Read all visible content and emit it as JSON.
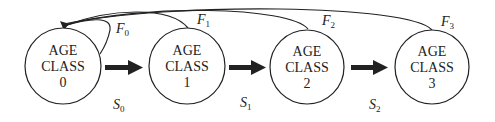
{
  "diagram": {
    "type": "age-structured population model (Leslie diagram)",
    "colors": {
      "stroke": "#222222",
      "background": "#ffffff"
    },
    "nodes": [
      {
        "id": "class0",
        "line1": "AGE",
        "line2": "CLASS",
        "line3": "0"
      },
      {
        "id": "class1",
        "line1": "AGE",
        "line2": "CLASS",
        "line3": "1"
      },
      {
        "id": "class2",
        "line1": "AGE",
        "line2": "CLASS",
        "line3": "2"
      },
      {
        "id": "class3",
        "line1": "AGE",
        "line2": "CLASS",
        "line3": "3"
      }
    ],
    "fecundity_labels": [
      {
        "base": "F",
        "sub": "0"
      },
      {
        "base": "F",
        "sub": "1"
      },
      {
        "base": "F",
        "sub": "2"
      },
      {
        "base": "F",
        "sub": "3"
      }
    ],
    "survival_labels": [
      {
        "base": "S",
        "sub": "0"
      },
      {
        "base": "S",
        "sub": "1"
      },
      {
        "base": "S",
        "sub": "2"
      }
    ],
    "edges": [
      {
        "from": "class0",
        "to": "class1",
        "kind": "survival",
        "label": "S0"
      },
      {
        "from": "class1",
        "to": "class2",
        "kind": "survival",
        "label": "S1"
      },
      {
        "from": "class2",
        "to": "class3",
        "kind": "survival",
        "label": "S2"
      },
      {
        "from": "class0",
        "to": "class0",
        "kind": "fecundity",
        "label": "F0"
      },
      {
        "from": "class1",
        "to": "class0",
        "kind": "fecundity",
        "label": "F1"
      },
      {
        "from": "class2",
        "to": "class0",
        "kind": "fecundity",
        "label": "F2"
      },
      {
        "from": "class3",
        "to": "class0",
        "kind": "fecundity",
        "label": "F3"
      }
    ]
  }
}
